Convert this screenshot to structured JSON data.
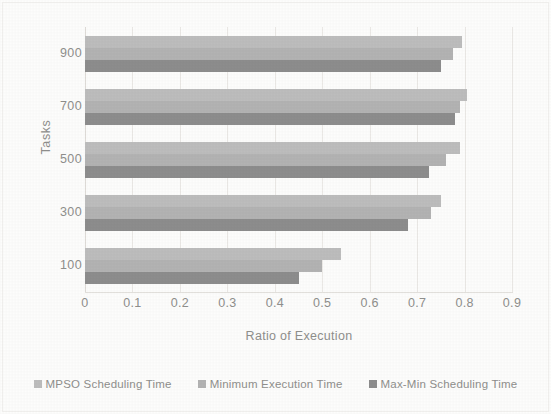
{
  "chart_data": {
    "type": "bar",
    "orientation": "horizontal",
    "title": "",
    "xlabel": "Ratio of Execution",
    "ylabel": "Tasks",
    "categories": [
      "100",
      "300",
      "500",
      "700",
      "900"
    ],
    "xlim": [
      0,
      0.9
    ],
    "xticks": [
      "0",
      "0.1",
      "0.2",
      "0.3",
      "0.4",
      "0.5",
      "0.6",
      "0.7",
      "0.8",
      "0.9"
    ],
    "xtick_values": [
      0,
      0.1,
      0.2,
      0.3,
      0.4,
      0.5,
      0.6,
      0.7,
      0.8,
      0.9
    ],
    "grid": true,
    "grid_axis": "x",
    "legend_position": "bottom",
    "series": [
      {
        "name": "MPSO Scheduling Time",
        "color": "#bdbdbd",
        "values": [
          0.54,
          0.75,
          0.79,
          0.805,
          0.795
        ]
      },
      {
        "name": "Minimum Execution Time",
        "color": "#b3b3b3",
        "values": [
          0.5,
          0.73,
          0.76,
          0.79,
          0.775
        ]
      },
      {
        "name": "Max-Min Scheduling Time",
        "color": "#8d8d8d",
        "values": [
          0.45,
          0.68,
          0.725,
          0.78,
          0.75
        ]
      }
    ]
  },
  "axes": {
    "y_title": "Tasks",
    "x_title": "Ratio of Execution"
  },
  "legend": {
    "items": [
      {
        "label": "MPSO Scheduling Time",
        "color": "#bdbdbd"
      },
      {
        "label": "Minimum Execution Time",
        "color": "#b3b3b3"
      },
      {
        "label": "Max-Min Scheduling Time",
        "color": "#8d8d8d"
      }
    ]
  }
}
